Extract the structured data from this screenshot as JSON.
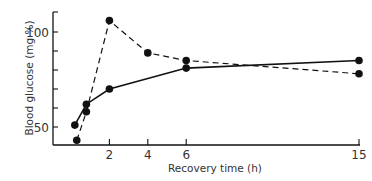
{
  "chart_data": {
    "type": "line",
    "title": "",
    "xlabel": "Recovery time (h)",
    "ylabel": "Blood glucose (mg %)",
    "xlim": [
      0,
      15
    ],
    "ylim": [
      45,
      108
    ],
    "x_ticks": [
      {
        "value": 2,
        "label": "2"
      },
      {
        "value": 4,
        "label": "4"
      },
      {
        "value": 6,
        "label": "6"
      },
      {
        "value": 15,
        "label": "15"
      }
    ],
    "y_ticks": [
      {
        "value": 50,
        "label": "50"
      },
      {
        "value": 60,
        "label": ""
      },
      {
        "value": 70,
        "label": ""
      },
      {
        "value": 80,
        "label": ""
      },
      {
        "value": 90,
        "label": ""
      },
      {
        "value": 100,
        "label": "100"
      }
    ],
    "grid": false,
    "legend": null,
    "series": [
      {
        "name": "solid",
        "style": "solid",
        "x": [
          0.2,
          0.8,
          2,
          6,
          15
        ],
        "y": [
          51,
          62,
          70,
          81,
          85
        ]
      },
      {
        "name": "dashed",
        "style": "dashed",
        "x": [
          0.3,
          0.8,
          2,
          4,
          6,
          15
        ],
        "y": [
          43,
          58,
          106,
          89,
          85,
          78
        ]
      }
    ]
  },
  "colors": {
    "ink": "#111111",
    "text": "#333333",
    "background": "#ffffff"
  }
}
